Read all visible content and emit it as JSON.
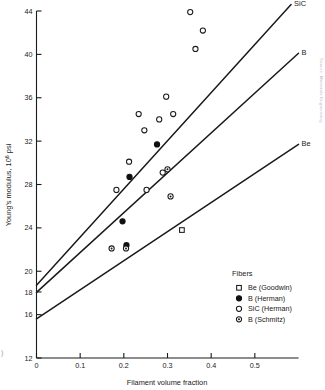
{
  "figure": {
    "credit_text": "Source: Materials Engineering",
    "corner_mark": ")"
  },
  "chart_data": {
    "type": "scatter",
    "title": "",
    "xlabel": "Filament volume fraction",
    "ylabel": "Young's modulus, 10⁶ psi",
    "ylabel_main": "Young's modulus, 10",
    "ylabel_sup": "6",
    "ylabel_tail": " psi",
    "xlim": [
      0,
      0.6
    ],
    "ylim": [
      12,
      44
    ],
    "grid": false,
    "xticks": [
      0,
      0.1,
      0.2,
      0.3,
      0.4,
      0.5
    ],
    "xticklabels": [
      "0",
      "0.1",
      "0.2",
      "0.3",
      "0.4",
      "0.5"
    ],
    "yticks": [
      12,
      16,
      20,
      24,
      28,
      32,
      36,
      40,
      44
    ],
    "yticklabels": [
      "12",
      "16",
      "20",
      "24",
      "28",
      "32",
      "36",
      "40",
      "44"
    ],
    "extra_yticks": [
      18
    ],
    "extra_yticklabels": [
      "18"
    ],
    "legend_position": "lower-right",
    "legend_title": "Fibers",
    "series": [
      {
        "name": "Be (Goodwin)",
        "marker": "square-open",
        "points": [
          [
            0.333,
            23.8
          ]
        ]
      },
      {
        "name": "B (Herman)",
        "marker": "circle-filled",
        "points": [
          [
            0.197,
            24.6
          ],
          [
            0.206,
            22.4
          ],
          [
            0.213,
            28.7
          ],
          [
            0.276,
            31.7
          ]
        ]
      },
      {
        "name": "SiC (Herman)",
        "marker": "circle-open",
        "points": [
          [
            0.183,
            27.5
          ],
          [
            0.212,
            30.1
          ],
          [
            0.234,
            34.5
          ],
          [
            0.247,
            33.0
          ],
          [
            0.252,
            27.5
          ],
          [
            0.281,
            34.0
          ],
          [
            0.289,
            29.1
          ],
          [
            0.297,
            36.1
          ],
          [
            0.313,
            34.5
          ],
          [
            0.352,
            43.9
          ],
          [
            0.364,
            40.5
          ],
          [
            0.381,
            42.2
          ]
        ]
      },
      {
        "name": "B (Schmitz)",
        "marker": "circle-dot",
        "points": [
          [
            0.172,
            22.1
          ],
          [
            0.205,
            22.1
          ],
          [
            0.3,
            29.4
          ],
          [
            0.307,
            26.9
          ]
        ]
      }
    ],
    "trend_lines": [
      {
        "label": "SiC",
        "x0": 0.0,
        "y0": 18.7,
        "x1": 0.583,
        "y1": 44.6
      },
      {
        "label": "B",
        "x0": 0.0,
        "y0": 18.05,
        "x1": 0.6,
        "y1": 40.1
      },
      {
        "label": "Be",
        "x0": 0.0,
        "y0": 15.6,
        "x1": 0.6,
        "y1": 31.7
      }
    ]
  }
}
